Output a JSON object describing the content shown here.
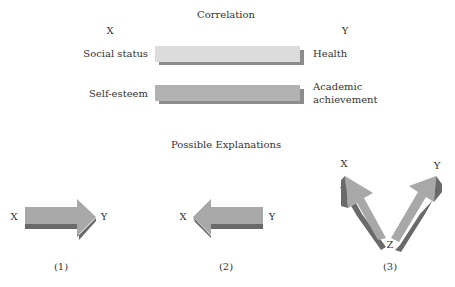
{
  "correlation": {
    "title": "Correlation",
    "x_header": "X",
    "y_header": "Y",
    "rows": [
      {
        "x_label": "Social status",
        "y_label": "Health",
        "bar_color": "#dcdcdc",
        "shadow_color": "#8c8c8c"
      },
      {
        "x_label": "Self-esteem",
        "y_label_line1": "Academic",
        "y_label_line2": "achievement",
        "bar_color": "#b2b2b2",
        "shadow_color": "#8c8c8c"
      }
    ]
  },
  "explanations": {
    "title": "Possible Explanations",
    "items": [
      {
        "number": "(1)",
        "from": "X",
        "to": "Y",
        "direction": "X causes Y"
      },
      {
        "number": "(2)",
        "from": "Y",
        "to": "X",
        "direction": "Y causes X"
      },
      {
        "number": "(3)",
        "source": "Z",
        "targets": [
          "X",
          "Y"
        ],
        "direction": "Z causes both X and Y"
      }
    ]
  },
  "colors": {
    "arrow_face": "#a8a8a8",
    "arrow_shadow": "#6a6a6a",
    "text": "#333333"
  }
}
